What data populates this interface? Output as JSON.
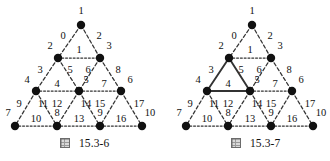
{
  "figures": [
    {
      "id": "fig-15-3-6",
      "caption_symbol": "图",
      "caption_number": "15.3-6",
      "origin_x": 0,
      "vertices": [
        {
          "label": "1",
          "x": 81,
          "y": 25,
          "lx": 81,
          "ly": 12
        },
        {
          "label": "2",
          "x": 58,
          "y": 58,
          "lx": 50,
          "ly": 47
        },
        {
          "label": "3",
          "x": 100,
          "y": 58,
          "lx": 109,
          "ly": 47
        },
        {
          "label": "4",
          "x": 36,
          "y": 91,
          "lx": 27,
          "ly": 81
        },
        {
          "label": "5",
          "x": 79,
          "y": 91,
          "lx": 86,
          "ly": 81
        },
        {
          "label": "6",
          "x": 121,
          "y": 91,
          "lx": 130,
          "ly": 81
        },
        {
          "label": "7",
          "x": 15,
          "y": 126,
          "lx": 8,
          "ly": 114
        },
        {
          "label": "8",
          "x": 57,
          "y": 126,
          "lx": 57,
          "ly": 114
        },
        {
          "label": "9",
          "x": 100,
          "y": 126,
          "lx": 100,
          "ly": 114
        },
        {
          "label": "10",
          "x": 142,
          "y": 126,
          "lx": 150,
          "ly": 114
        }
      ],
      "edges": [
        {
          "label": "0",
          "from": "1",
          "to": "2",
          "style": "dashed",
          "lx": 63,
          "ly": 37
        },
        {
          "label": "2",
          "from": "1",
          "to": "3",
          "style": "dashed",
          "lx": 99,
          "ly": 37
        },
        {
          "label": "1",
          "from": "2",
          "to": "3",
          "style": "dotted",
          "lx": 79,
          "ly": 51
        },
        {
          "label": "3",
          "from": "2",
          "to": "4",
          "style": "dashed",
          "lx": 40,
          "ly": 71
        },
        {
          "label": "5",
          "from": "2",
          "to": "5",
          "style": "dashed",
          "lx": 70,
          "ly": 71
        },
        {
          "label": "6",
          "from": "3",
          "to": "5",
          "style": "dashed",
          "lx": 88,
          "ly": 71
        },
        {
          "label": "8",
          "from": "3",
          "to": "6",
          "style": "dashed",
          "lx": 118,
          "ly": 71
        },
        {
          "label": "4",
          "from": "4",
          "to": "5",
          "style": "dotted",
          "lx": 57,
          "ly": 85
        },
        {
          "label": "7",
          "from": "5",
          "to": "6",
          "style": "dotted",
          "lx": 104,
          "ly": 85
        },
        {
          "label": "9",
          "from": "4",
          "to": "7",
          "style": "dashed",
          "lx": 19,
          "ly": 105
        },
        {
          "label": "11",
          "from": "4",
          "to": "8",
          "style": "dashed",
          "lx": 43,
          "ly": 105
        },
        {
          "label": "12",
          "from": "5",
          "to": "8",
          "style": "dashed",
          "lx": 57,
          "ly": 105
        },
        {
          "label": "14",
          "from": "5",
          "to": "9",
          "style": "dashed",
          "lx": 86,
          "ly": 105
        },
        {
          "label": "15",
          "from": "6",
          "to": "9",
          "style": "dashed",
          "lx": 100,
          "ly": 105
        },
        {
          "label": "17",
          "from": "6",
          "to": "10",
          "style": "dashed",
          "lx": 139,
          "ly": 105
        },
        {
          "label": "10",
          "from": "7",
          "to": "8",
          "style": "dotted",
          "lx": 36,
          "ly": 120
        },
        {
          "label": "13",
          "from": "8",
          "to": "9",
          "style": "dotted",
          "lx": 79,
          "ly": 120
        },
        {
          "label": "16",
          "from": "9",
          "to": "10",
          "style": "dotted",
          "lx": 121,
          "ly": 120
        }
      ]
    },
    {
      "id": "fig-15-3-7",
      "caption_symbol": "图",
      "caption_number": "15.3-7",
      "origin_x": 171,
      "vertices": [
        {
          "label": "1",
          "x": 252,
          "y": 25,
          "lx": 252,
          "ly": 12
        },
        {
          "label": "2",
          "x": 229,
          "y": 58,
          "lx": 221,
          "ly": 47
        },
        {
          "label": "3",
          "x": 271,
          "y": 58,
          "lx": 280,
          "ly": 47
        },
        {
          "label": "4",
          "x": 207,
          "y": 91,
          "lx": 198,
          "ly": 81
        },
        {
          "label": "5",
          "x": 250,
          "y": 91,
          "lx": 257,
          "ly": 81
        },
        {
          "label": "6",
          "x": 292,
          "y": 91,
          "lx": 301,
          "ly": 81
        },
        {
          "label": "7",
          "x": 186,
          "y": 126,
          "lx": 179,
          "ly": 114
        },
        {
          "label": "8",
          "x": 228,
          "y": 126,
          "lx": 228,
          "ly": 114
        },
        {
          "label": "9",
          "x": 271,
          "y": 126,
          "lx": 271,
          "ly": 114
        },
        {
          "label": "10",
          "x": 313,
          "y": 126,
          "lx": 321,
          "ly": 114
        }
      ],
      "edges": [
        {
          "label": "0",
          "from": "1",
          "to": "2",
          "style": "dashed",
          "lx": 234,
          "ly": 37
        },
        {
          "label": "2",
          "from": "1",
          "to": "3",
          "style": "dashed",
          "lx": 270,
          "ly": 37
        },
        {
          "label": "1",
          "from": "2",
          "to": "3",
          "style": "dotted",
          "lx": 250,
          "ly": 51
        },
        {
          "label": "3",
          "from": "2",
          "to": "4",
          "style": "solid",
          "lx": 211,
          "ly": 71
        },
        {
          "label": "5",
          "from": "2",
          "to": "5",
          "style": "solid",
          "lx": 241,
          "ly": 71
        },
        {
          "label": "6",
          "from": "3",
          "to": "5",
          "style": "dashed",
          "lx": 259,
          "ly": 71
        },
        {
          "label": "8",
          "from": "3",
          "to": "6",
          "style": "dashed",
          "lx": 289,
          "ly": 71
        },
        {
          "label": "4",
          "from": "4",
          "to": "5",
          "style": "solid",
          "lx": 228,
          "ly": 85
        },
        {
          "label": "7",
          "from": "5",
          "to": "6",
          "style": "dotted",
          "lx": 275,
          "ly": 85
        },
        {
          "label": "9",
          "from": "4",
          "to": "7",
          "style": "dashed",
          "lx": 190,
          "ly": 105
        },
        {
          "label": "11",
          "from": "4",
          "to": "8",
          "style": "dashed",
          "lx": 214,
          "ly": 105
        },
        {
          "label": "12",
          "from": "5",
          "to": "8",
          "style": "dashed",
          "lx": 228,
          "ly": 105
        },
        {
          "label": "14",
          "from": "5",
          "to": "9",
          "style": "dashed",
          "lx": 257,
          "ly": 105
        },
        {
          "label": "15",
          "from": "6",
          "to": "9",
          "style": "dashed",
          "lx": 271,
          "ly": 105
        },
        {
          "label": "17",
          "from": "6",
          "to": "10",
          "style": "dashed",
          "lx": 310,
          "ly": 105
        },
        {
          "label": "10",
          "from": "7",
          "to": "8",
          "style": "dotted",
          "lx": 207,
          "ly": 120
        },
        {
          "label": "13",
          "from": "8",
          "to": "9",
          "style": "dotted",
          "lx": 250,
          "ly": 120
        },
        {
          "label": "16",
          "from": "9",
          "to": "10",
          "style": "dotted",
          "lx": 292,
          "ly": 120
        }
      ]
    }
  ],
  "style": {
    "node_color": "#111111",
    "edge_color": "#333333",
    "text_color": "#111111",
    "node_radius": 4.2
  }
}
